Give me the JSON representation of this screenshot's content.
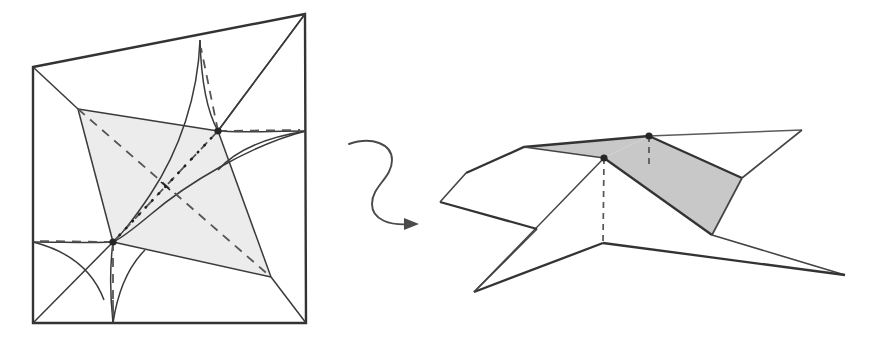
{
  "figure": {
    "caption": "",
    "background_color": "#ffffff",
    "ink_color": "#3a3a3a",
    "ink_color_dark": "#2e2e2e",
    "shade_left": "#ececec",
    "shade_right": "#c8c8c8",
    "vertex_color": "#262626",
    "stroke_thin": 1.1,
    "stroke_medium": 1.6,
    "stroke_thick": 2.4,
    "panels": [
      {
        "name": "crease-pattern",
        "label": ""
      },
      {
        "name": "folded-form",
        "label": ""
      }
    ],
    "arrow": {
      "name": "transformation-arrow",
      "style": "squiggly-s-curve",
      "direction": "left-to-right",
      "label": ""
    },
    "left_panel": {
      "name": "crease-pattern-panel",
      "outer_quad": [
        [
          33,
          67
        ],
        [
          305,
          14
        ],
        [
          306,
          323
        ],
        [
          33,
          323
        ]
      ],
      "shaded_quad": [
        [
          78,
          109
        ],
        [
          218,
          131
        ],
        [
          271,
          277
        ],
        [
          113,
          242
        ]
      ],
      "nodes": [
        {
          "name": "node-upper-right",
          "x": 218,
          "y": 131
        },
        {
          "name": "node-lower-left",
          "x": 113,
          "y": 242
        }
      ],
      "cusp_points": [
        {
          "name": "cusp-top-edge",
          "x": 200,
          "y": 40
        },
        {
          "name": "cusp-right-edge",
          "x": 306,
          "y": 131
        },
        {
          "name": "cusp-bottom-edge",
          "x": 113,
          "y": 323
        },
        {
          "name": "cusp-left-edge",
          "x": 33,
          "y": 242
        }
      ],
      "dotted_segment": {
        "name": "dotted-connector",
        "from": [
          113,
          242
        ],
        "to": [
          218,
          131
        ]
      },
      "dashed_diagonals": [
        {
          "name": "dashed-diagonal-a",
          "from": [
            78,
            109
          ],
          "to": [
            271,
            277
          ]
        },
        {
          "name": "dashed-diagonal-b",
          "from": [
            113,
            242
          ],
          "to": [
            218,
            131
          ]
        }
      ]
    },
    "right_panel": {
      "name": "folded-form-panel",
      "apex_high": {
        "name": "apex-high-vertex",
        "x": 649,
        "y": 136
      },
      "apex_low": {
        "name": "apex-low-vertex",
        "x": 604,
        "y": 158
      },
      "base_vertex": {
        "name": "base-vertex",
        "x": 603,
        "y": 243
      },
      "shaded_faces": 2,
      "dashed_drop_lines": [
        {
          "name": "drop-line-high",
          "from": [
            649,
            136
          ],
          "to": [
            649,
            165
          ]
        },
        {
          "name": "drop-line-low",
          "from": [
            604,
            158
          ],
          "to": [
            603,
            243
          ]
        }
      ],
      "outline_points": [
        [
          466,
          173
        ],
        [
          524,
          147
        ],
        [
          649,
          136
        ],
        [
          802,
          130
        ],
        [
          742,
          178
        ],
        [
          845,
          275
        ],
        [
          712,
          235
        ],
        [
          603,
          243
        ],
        [
          474,
          292
        ],
        [
          537,
          229
        ],
        [
          440,
          202
        ]
      ]
    }
  }
}
